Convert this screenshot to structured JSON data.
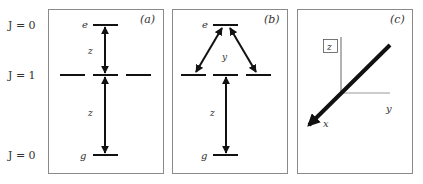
{
  "colors": {
    "frame": "#8a8a8a",
    "line": "#111111",
    "axis": "#888888",
    "text": "#333333"
  },
  "j_labels": {
    "top": "J = 0",
    "middle": "J = 1",
    "bottom": "J = 0"
  },
  "panel_a": {
    "tag": "(a)",
    "excited": "e",
    "ground": "g",
    "upper_pol": "z",
    "lower_pol": "z"
  },
  "panel_b": {
    "tag": "(b)",
    "excited": "e",
    "ground": "g",
    "upper_pol": "y",
    "lower_pol": "z"
  },
  "panel_c": {
    "tag": "(c)",
    "z_axis": "z",
    "y_axis": "y",
    "x_axis": "x"
  }
}
